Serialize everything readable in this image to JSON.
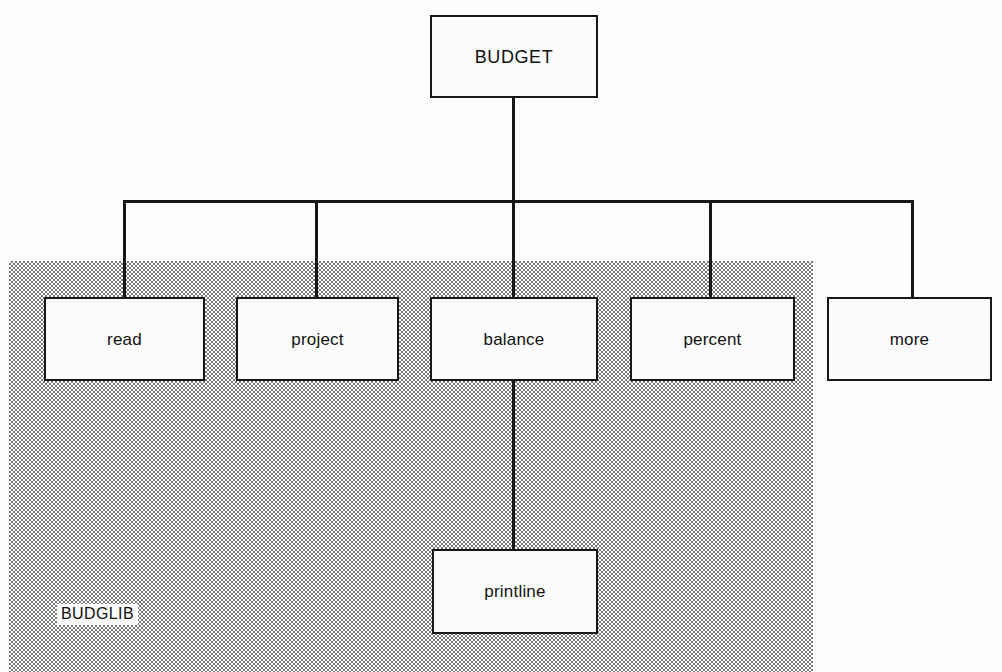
{
  "diagram": {
    "type": "call-hierarchy-tree",
    "colors": {
      "line": "#171717",
      "box_fill": "#fcfcfc",
      "box_border": "#171717",
      "shade_region": "#9a9a9a",
      "page_background": "#ffffff",
      "text": "#111111"
    },
    "root": {
      "label": "BUDGET"
    },
    "children": [
      {
        "label": "read"
      },
      {
        "label": "project"
      },
      {
        "label": "balance"
      },
      {
        "label": "percent"
      },
      {
        "label": "more"
      }
    ],
    "grandchildren": [
      {
        "label": "printline",
        "parent": "balance"
      }
    ],
    "region": {
      "label": "BUDGLIB",
      "contains": [
        "read",
        "project",
        "balance",
        "percent",
        "printline"
      ],
      "excludes": [
        "more",
        "BUDGET"
      ]
    }
  }
}
